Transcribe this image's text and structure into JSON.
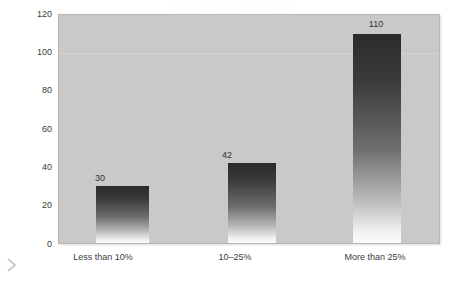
{
  "chart_data": {
    "type": "bar",
    "title": "Number of countries, by share",
    "xlabel": "",
    "ylabel": "Number of countries",
    "categories": [
      "Less than 10%",
      "10–25%",
      "More than 25%"
    ],
    "values": [
      30,
      42,
      110
    ],
    "value_labels": [
      "30",
      "42",
      "110"
    ],
    "ylim": [
      0,
      120
    ],
    "yticks": [
      0,
      20,
      40,
      60,
      80,
      100,
      120
    ],
    "ytick_labels": [
      "0",
      "20",
      "40",
      "60",
      "80",
      "100",
      "120"
    ],
    "grid": true,
    "gridlines_at": [
      100
    ],
    "legend": null,
    "legend_position": "none",
    "colors": {
      "plot_background": "#c9c9c9",
      "figure_background": "#ffffff",
      "bar_gradient_top": "#2b2b2b",
      "bar_gradient_bottom": "#fbfbfb",
      "axis_text": "#3b3b3b",
      "gridline": "#d4d4d4",
      "plot_border": "#b7b7b7",
      "chevron": "#bcbcbc",
      "title_text": "#fdfdfd"
    }
  },
  "icons": {
    "chevron_right": "chevron-right-icon"
  }
}
